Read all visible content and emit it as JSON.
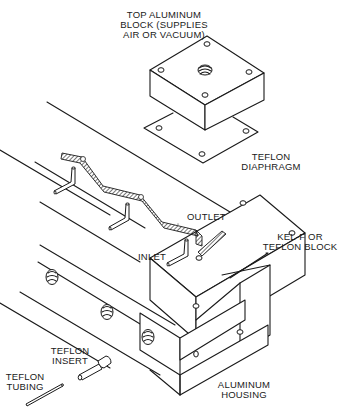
{
  "figure": {
    "type": "exploded-isometric-assembly-drawing",
    "line_color": "#1a1a1a",
    "background": "#ffffff"
  },
  "labels": {
    "top_block": [
      "TOP ALUMINUM",
      "BLOCK (SUPPLIES",
      "AIR OR VACUUM)"
    ],
    "diaphragm": [
      "TEFLON",
      "DIAPHRAGM"
    ],
    "outlet": "OUTLET",
    "inlet": "INLET",
    "kelf_block": [
      "KEL-F OR",
      "TEFLON BLOCK"
    ],
    "insert": [
      "TEFLON",
      "INSERT"
    ],
    "tubing": [
      "TEFLON",
      "TUBING"
    ],
    "housing": [
      "ALUMINUM",
      "HOUSING"
    ]
  },
  "components": [
    {
      "id": "top-aluminum-block",
      "name": "Top Aluminum Block",
      "function": "Supplies air or vacuum"
    },
    {
      "id": "teflon-diaphragm",
      "name": "Teflon Diaphragm"
    },
    {
      "id": "kelf-teflon-block",
      "name": "Kel-F or Teflon Block",
      "ports": [
        "Inlet",
        "Outlet"
      ]
    },
    {
      "id": "aluminum-housing",
      "name": "Aluminum Housing"
    },
    {
      "id": "teflon-insert",
      "name": "Teflon Insert"
    },
    {
      "id": "teflon-tubing",
      "name": "Teflon Tubing"
    }
  ]
}
